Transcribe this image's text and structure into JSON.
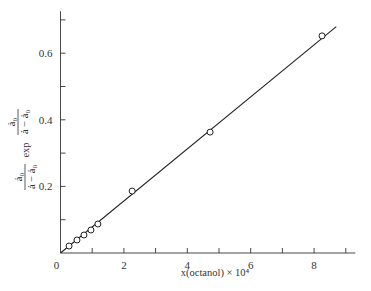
{
  "chart_data": {
    "type": "scatter",
    "title": "",
    "xlabel": "x(octanol) × 10⁴",
    "ylabel": "(ȧ₀/(ȧ − ȧ₀)) exp (ȧ₀/(ȧ − ȧ₀))",
    "ylabel_parts": {
      "left_num": "ȧ₀",
      "left_den": "ȧ − ȧ₀",
      "mid": "exp",
      "right_num": "ȧ₀",
      "right_den": "ȧ − ȧ₀"
    },
    "xlim": [
      0,
      9.3
    ],
    "ylim": [
      0,
      0.72
    ],
    "x_ticks": [
      1,
      2,
      3,
      4,
      5,
      6,
      7,
      8,
      9
    ],
    "x_tick_labels": [
      "0",
      "2",
      "4",
      "6",
      "8"
    ],
    "x_tick_label_values": [
      0,
      2,
      4,
      6,
      8
    ],
    "y_ticks": [
      0.1,
      0.2,
      0.3,
      0.4,
      0.5,
      0.6,
      0.7
    ],
    "y_tick_labels": [
      "0.2",
      "0.4",
      "0.6"
    ],
    "y_tick_label_values": [
      0.2,
      0.4,
      0.6
    ],
    "grid": false,
    "series": [
      {
        "name": "data",
        "marker": "open-circle",
        "x": [
          0.27,
          0.52,
          0.74,
          0.96,
          1.18,
          2.26,
          4.72,
          8.25
        ],
        "y": [
          0.021,
          0.039,
          0.054,
          0.069,
          0.087,
          0.186,
          0.363,
          0.652
        ]
      },
      {
        "name": "fit",
        "style": "line",
        "x": [
          0,
          8.7
        ],
        "y": [
          0,
          0.68
        ]
      }
    ]
  }
}
